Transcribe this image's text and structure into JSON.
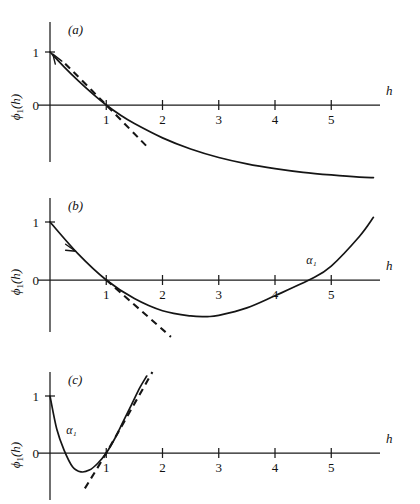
{
  "figure": {
    "name": "three-panel-function-plot",
    "background": "#ffffff",
    "ink_color": "#151515"
  },
  "chart_data": [
    {
      "type": "line",
      "panel_label": "(a)",
      "title": "",
      "xlabel": "h",
      "ylabel": "ϕ₁(h)",
      "ylabel_parts": {
        "symbol": "ϕ",
        "subscript": "1",
        "argument": "(h)"
      },
      "xlim": [
        -0.22,
        5.9
      ],
      "ylim": [
        -1.6,
        1.45
      ],
      "xticks": [
        1,
        2,
        3,
        4,
        5
      ],
      "xtick_labels": [
        "1",
        "2",
        "3",
        "4",
        "5"
      ],
      "yticks": [
        0,
        1
      ],
      "ytick_labels": [
        "0",
        "1"
      ],
      "grid": false,
      "legend": "none",
      "annotations": [],
      "series": [
        {
          "name": "phi1-curve",
          "style": "solid",
          "description": "monotonically decreasing convex curve from (0,1) crossing zero at h=1 and flattening toward an asymptote near -1.4",
          "x": [
            0.0,
            0.25,
            0.5,
            0.75,
            1.0,
            1.25,
            1.5,
            2.0,
            2.5,
            3.0,
            3.5,
            4.0,
            4.5,
            5.0,
            5.5,
            5.75
          ],
          "y": [
            1.0,
            0.72,
            0.46,
            0.22,
            0.0,
            -0.19,
            -0.35,
            -0.62,
            -0.83,
            -0.99,
            -1.11,
            -1.2,
            -1.27,
            -1.32,
            -1.36,
            -1.37
          ]
        },
        {
          "name": "tangent-at-h1",
          "style": "dashed",
          "description": "dashed tangent line touching the curve at h = 1 with slope about -1",
          "x": [
            0.27,
            1.0,
            1.72
          ],
          "y": [
            0.78,
            0.0,
            -0.78
          ]
        }
      ],
      "markers": [
        {
          "name": "direction-arrowhead",
          "x": 0.05,
          "y": 0.96,
          "points": "up-left"
        }
      ]
    },
    {
      "type": "line",
      "panel_label": "(b)",
      "title": "",
      "xlabel": "h",
      "ylabel": "ϕ₁(h)",
      "ylabel_parts": {
        "symbol": "ϕ",
        "subscript": "1",
        "argument": "(h)"
      },
      "xlim": [
        -0.22,
        5.9
      ],
      "ylim": [
        -1.15,
        1.45
      ],
      "xticks": [
        1,
        2,
        3,
        4,
        5
      ],
      "xtick_labels": [
        "1",
        "2",
        "3",
        "4",
        "5"
      ],
      "yticks": [
        0,
        1
      ],
      "ytick_labels": [
        "0",
        "1"
      ],
      "grid": false,
      "legend": "none",
      "annotations": [
        {
          "name": "alpha1-root-label",
          "text": "α₁",
          "x": 4.65,
          "y": 0.28,
          "meaning": "second zero crossing of the curve"
        }
      ],
      "series": [
        {
          "name": "phi1-curve",
          "style": "solid",
          "description": "convex parabola-like curve from (0,1), crossing zero at h=1, minimum near h=2.8 at about -0.62, rising back through zero at h=4.65",
          "x": [
            0.0,
            0.5,
            1.0,
            1.5,
            2.0,
            2.5,
            2.8,
            3.0,
            3.5,
            4.0,
            4.65,
            5.0,
            5.5,
            5.75
          ],
          "y": [
            1.0,
            0.45,
            0.0,
            -0.32,
            -0.53,
            -0.62,
            -0.63,
            -0.61,
            -0.48,
            -0.27,
            0.02,
            0.24,
            0.75,
            1.08
          ]
        },
        {
          "name": "tangent-at-h1",
          "style": "dashed",
          "description": "dashed tangent line touching the curve at h = 1, slope about -0.85, extended to h = 2.1",
          "x": [
            1.0,
            2.15
          ],
          "y": [
            0.0,
            -0.98
          ]
        }
      ],
      "markers": [
        {
          "name": "direction-arrowhead",
          "x": 0.42,
          "y": 0.53,
          "points": "down-right"
        }
      ]
    },
    {
      "type": "line",
      "panel_label": "(c)",
      "title": "",
      "xlabel": "h",
      "ylabel": "ϕ₁(h)",
      "ylabel_parts": {
        "symbol": "ϕ",
        "subscript": "1",
        "argument": "(h)"
      },
      "xlim": [
        -0.22,
        5.9
      ],
      "ylim": [
        -1.0,
        1.45
      ],
      "xticks": [
        1,
        2,
        3,
        4,
        5
      ],
      "xtick_labels": [
        "1",
        "2",
        "3",
        "4",
        "5"
      ],
      "yticks": [
        0,
        1
      ],
      "ytick_labels": [
        "0",
        "1"
      ],
      "grid": false,
      "legend": "none",
      "annotations": [
        {
          "name": "alpha1-root-label",
          "text": "α₁",
          "x": 0.38,
          "y": 0.33,
          "meaning": "first zero crossing of the curve, left of h = 1"
        }
      ],
      "series": [
        {
          "name": "phi1-curve",
          "style": "solid",
          "description": "curve starting at (0,1) dropping steeply through zero near h=0.28, shallow minimum about -0.33 near h=0.57, rising through zero at h=1 and climbing steeply",
          "x": [
            0.0,
            0.12,
            0.25,
            0.4,
            0.55,
            0.7,
            0.85,
            1.0,
            1.15,
            1.3,
            1.45,
            1.6,
            1.72
          ],
          "y": [
            1.0,
            0.42,
            0.05,
            -0.24,
            -0.33,
            -0.3,
            -0.18,
            0.0,
            0.25,
            0.55,
            0.85,
            1.15,
            1.35
          ]
        },
        {
          "name": "tangent-at-h1",
          "style": "dashed",
          "description": "dashed tangent line touching the curve at h = 1 with steep positive slope, drawn from below-left to upper-right",
          "x": [
            0.62,
            1.0,
            1.82
          ],
          "y": [
            -0.62,
            0.0,
            1.42
          ]
        }
      ],
      "markers": []
    }
  ],
  "axis_labels": {
    "x_axis_name": "h",
    "y_axis_name_symbol": "ϕ",
    "y_axis_name_subscript": "1",
    "y_axis_name_argument": "(h)"
  }
}
